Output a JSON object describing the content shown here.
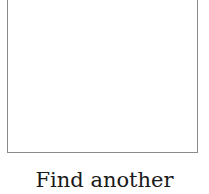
{
  "card": {
    "image": {
      "description": "blank white image area",
      "border_color": "#8a8a8a"
    },
    "link_label": "Find another"
  }
}
